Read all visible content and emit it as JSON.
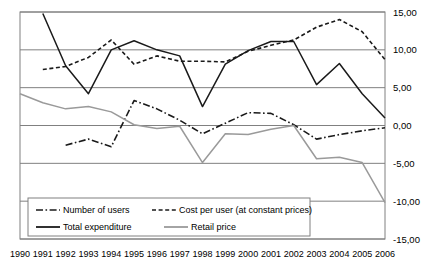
{
  "chart_data": {
    "type": "line",
    "title": "",
    "subtitle": "",
    "xlabel": "",
    "ylabel": "",
    "xlim": [
      1990,
      2006
    ],
    "ylim": [
      -15,
      15
    ],
    "grid": true,
    "grid_axis": "y",
    "legend_position": "bottom-left",
    "decimal_separator": ",",
    "x": [
      1990,
      1991,
      1992,
      1993,
      1994,
      1995,
      1996,
      1997,
      1998,
      1999,
      2000,
      2001,
      2002,
      2003,
      2004,
      2005,
      2006
    ],
    "xtick_labels": [
      "1990",
      "1991",
      "1992",
      "1993",
      "1994",
      "1995",
      "1996",
      "1997",
      "1998",
      "1999",
      "2000",
      "2001",
      "2002",
      "2003",
      "2004",
      "2005",
      "2006"
    ],
    "ytick_values": [
      15,
      10,
      5,
      0,
      -5,
      -10,
      -15
    ],
    "ytick_labels": [
      "15,00",
      "10,00",
      "5,00",
      "0,00",
      "-5,00",
      "-10,00",
      "-15,00"
    ],
    "series": [
      {
        "name": "Number of users",
        "style": "dash-dot",
        "color": "#1a1a1a",
        "x": [
          1990,
          1991,
          1992,
          1993,
          1994,
          1995,
          1996,
          1997,
          1998,
          1999,
          2000,
          2001,
          2002,
          2003,
          2004,
          2005,
          2006
        ],
        "values": [
          2.8,
          null,
          -2.6,
          -1.8,
          -2.8,
          3.3,
          2.2,
          0.7,
          -1.1,
          0.3,
          1.7,
          1.6,
          0.1,
          -1.8,
          -1.2,
          -0.7,
          -0.3
        ]
      },
      {
        "name": "Cost per user (at constant prices)",
        "style": "dotted",
        "color": "#1a1a1a",
        "x": [
          1990,
          1991,
          1992,
          1993,
          1994,
          1995,
          1996,
          1997,
          1998,
          1999,
          2000,
          2001,
          2002,
          2003,
          2004,
          2005,
          2006
        ],
        "values": [
          null,
          7.4,
          7.8,
          9.0,
          11.3,
          8.1,
          9.2,
          8.5,
          8.5,
          8.4,
          9.8,
          10.6,
          11.3,
          13.0,
          14.0,
          12.4,
          8.7
        ]
      },
      {
        "name": "Total expenditure",
        "style": "solid",
        "color": "#1a1a1a",
        "x": [
          1990,
          1991,
          1992,
          1993,
          1994,
          1995,
          1996,
          1997,
          1998,
          1999,
          2000,
          2001,
          2002,
          2003,
          2004,
          2005,
          2006
        ],
        "values": [
          null,
          14.8,
          7.9,
          4.2,
          10.0,
          11.2,
          10.0,
          9.2,
          2.5,
          8.1,
          9.9,
          11.1,
          11.1,
          5.4,
          8.2,
          4.2,
          1.0
        ]
      },
      {
        "name": "Retail price",
        "style": "solid",
        "color": "#9a9a9a",
        "x": [
          1990,
          1991,
          1992,
          1993,
          1994,
          1995,
          1996,
          1997,
          1998,
          1999,
          2000,
          2001,
          2002,
          2003,
          2004,
          2005,
          2006
        ],
        "values": [
          4.2,
          3.0,
          2.2,
          2.5,
          1.8,
          0.1,
          -0.4,
          -0.1,
          -4.9,
          -1.1,
          -1.2,
          -0.5,
          0.0,
          -4.4,
          -4.2,
          -4.9,
          -10.2
        ]
      }
    ]
  },
  "legend": {
    "items": [
      {
        "label": "Number of users",
        "style": "dash-dot",
        "color": "#1a1a1a"
      },
      {
        "label": "Cost per user (at constant prices)",
        "style": "dotted",
        "color": "#1a1a1a"
      },
      {
        "label": "Total expenditure",
        "style": "solid",
        "color": "#1a1a1a"
      },
      {
        "label": "Retail price",
        "style": "solid",
        "color": "#9a9a9a"
      }
    ]
  },
  "colors": {
    "plot_border": "#808080",
    "gridline": "#808080",
    "background": "#ffffff",
    "primary_line": "#1a1a1a",
    "secondary_line": "#9a9a9a"
  }
}
